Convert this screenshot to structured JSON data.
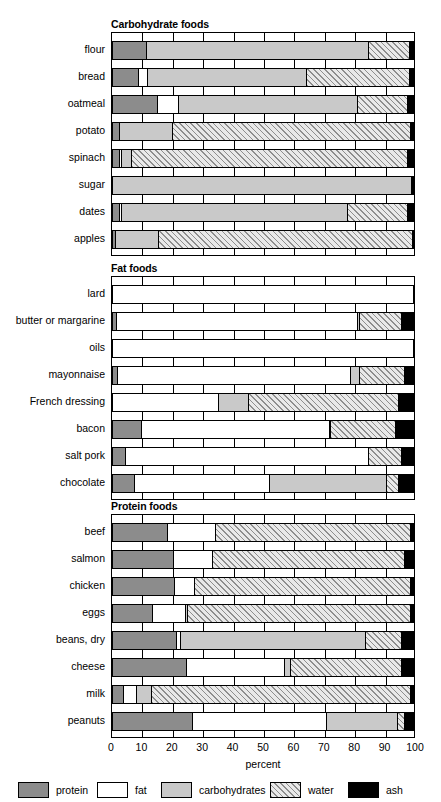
{
  "chart_data": {
    "type": "bar",
    "subtype": "stacked-horizontal-100pct",
    "title": "",
    "xlabel": "percent",
    "ylabel": "",
    "xlim": [
      0,
      100
    ],
    "xticks": [
      "0",
      "10",
      "20",
      "30",
      "40",
      "50",
      "60",
      "70",
      "80",
      "90",
      "100"
    ],
    "grid": true,
    "legend_position": "bottom",
    "series": [
      {
        "name": "protein",
        "color": "#8c8c8c",
        "pattern": "solid-gray"
      },
      {
        "name": "fat",
        "color": "#ffffff",
        "pattern": "solid-white"
      },
      {
        "name": "carbohydrates",
        "color": "#c9c9c9",
        "pattern": "solid-lightgray"
      },
      {
        "name": "water",
        "color": "#e9e9e9",
        "pattern": "diagonal-hatch"
      },
      {
        "name": "ash",
        "color": "#000000",
        "pattern": "solid-black"
      }
    ],
    "panels": [
      {
        "title": "Carbohydrate foods",
        "categories": [
          "flour",
          "bread",
          "oatmeal",
          "potato",
          "spinach",
          "sugar",
          "dates",
          "apples"
        ],
        "values": {
          "flour": {
            "protein": 11.0,
            "fat": 0.0,
            "carbohydrates": 74.0,
            "water": 13.5,
            "ash": 1.5
          },
          "bread": {
            "protein": 8.5,
            "fat": 3.0,
            "carbohydrates": 53.0,
            "water": 34.0,
            "ash": 1.5
          },
          "oatmeal": {
            "protein": 14.5,
            "fat": 7.0,
            "carbohydrates": 60.0,
            "water": 16.5,
            "ash": 2.0
          },
          "potato": {
            "protein": 2.0,
            "fat": 0.0,
            "carbohydrates": 17.5,
            "water": 79.5,
            "ash": 1.0
          },
          "spinach": {
            "protein": 2.0,
            "fat": 0.5,
            "carbohydrates": 3.5,
            "water": 92.0,
            "ash": 2.0
          },
          "sugar": {
            "protein": 0.0,
            "fat": 0.0,
            "carbohydrates": 99.5,
            "water": 0.0,
            "ash": 0.5
          },
          "dates": {
            "protein": 2.0,
            "fat": 0.5,
            "carbohydrates": 75.5,
            "water": 20.0,
            "ash": 2.0
          },
          "apples": {
            "protein": 0.5,
            "fat": 0.0,
            "carbohydrates": 14.5,
            "water": 84.5,
            "ash": 0.5
          }
        }
      },
      {
        "title": "Fat foods",
        "categories": [
          "lard",
          "butter or margarine",
          "oils",
          "mayonnaise",
          "French dressing",
          "bacon",
          "salt pork",
          "chocolate"
        ],
        "values": {
          "lard": {
            "protein": 0.0,
            "fat": 100.0,
            "carbohydrates": 0.0,
            "water": 0.0,
            "ash": 0.0
          },
          "butter or margarine": {
            "protein": 1.0,
            "fat": 80.5,
            "carbohydrates": 0.5,
            "water": 14.0,
            "ash": 4.0
          },
          "oils": {
            "protein": 0.0,
            "fat": 100.0,
            "carbohydrates": 0.0,
            "water": 0.0,
            "ash": 0.0
          },
          "mayonnaise": {
            "protein": 1.5,
            "fat": 77.5,
            "carbohydrates": 3.0,
            "water": 15.0,
            "ash": 3.0
          },
          "French dressing": {
            "protein": 0.0,
            "fat": 35.0,
            "carbohydrates": 10.0,
            "water": 50.0,
            "ash": 5.0
          },
          "bacon": {
            "protein": 9.5,
            "fat": 62.5,
            "carbohydrates": 0.5,
            "water": 21.5,
            "ash": 6.0
          },
          "salt pork": {
            "protein": 4.0,
            "fat": 81.0,
            "carbohydrates": 0.0,
            "water": 11.0,
            "ash": 4.0
          },
          "chocolate": {
            "protein": 7.0,
            "fat": 45.0,
            "carbohydrates": 39.0,
            "water": 4.0,
            "ash": 5.0
          }
        }
      },
      {
        "title": "Protein foods",
        "categories": [
          "beef",
          "salmon",
          "chicken",
          "eggs",
          "beans, dry",
          "cheese",
          "milk",
          "peanuts"
        ],
        "values": {
          "beef": {
            "protein": 18.0,
            "fat": 16.0,
            "carbohydrates": 0.0,
            "water": 65.0,
            "ash": 1.0
          },
          "salmon": {
            "protein": 20.0,
            "fat": 13.0,
            "carbohydrates": 0.0,
            "water": 64.0,
            "ash": 3.0
          },
          "chicken": {
            "protein": 20.5,
            "fat": 6.5,
            "carbohydrates": 0.0,
            "water": 72.0,
            "ash": 1.0
          },
          "eggs": {
            "protein": 13.0,
            "fat": 11.0,
            "carbohydrates": 0.5,
            "water": 74.5,
            "ash": 1.0
          },
          "beans, dry": {
            "protein": 21.0,
            "fat": 1.5,
            "carbohydrates": 61.5,
            "water": 12.0,
            "ash": 4.0
          },
          "cheese": {
            "protein": 24.5,
            "fat": 32.5,
            "carbohydrates": 2.0,
            "water": 37.0,
            "ash": 4.0
          },
          "milk": {
            "protein": 3.5,
            "fat": 4.0,
            "carbohydrates": 5.0,
            "water": 86.5,
            "ash": 1.0
          },
          "peanuts": {
            "protein": 26.5,
            "fat": 44.5,
            "carbohydrates": 23.5,
            "water": 2.5,
            "ash": 3.0
          }
        }
      }
    ],
    "legend": [
      {
        "label": "protein"
      },
      {
        "label": "fat"
      },
      {
        "label": "carbohydrates"
      },
      {
        "label": "water"
      },
      {
        "label": "ash"
      }
    ]
  }
}
